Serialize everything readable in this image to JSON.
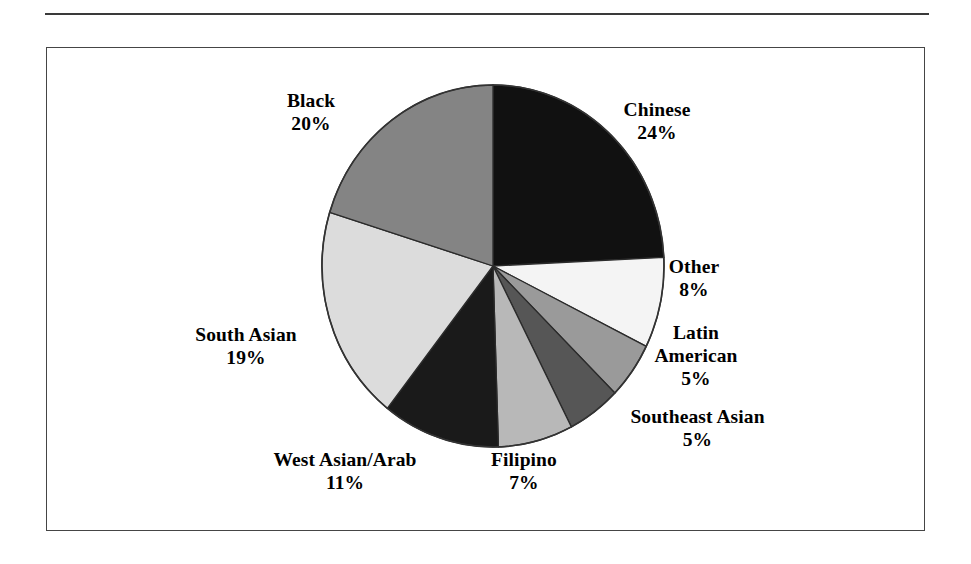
{
  "figure": {
    "background_color": "#ffffff",
    "border_color": "#454545",
    "rule_color": "#3a3a3a"
  },
  "chart_data": {
    "type": "pie",
    "title": "",
    "subtitle": "",
    "xlabel": "",
    "ylabel": "",
    "legend_position": "none",
    "grid": false,
    "start_angle_deg": 0,
    "direction": "clockwise",
    "value_unit": "percent",
    "categories": [
      "Chinese",
      "Other",
      "Latin American",
      "Southeast Asian",
      "Filipino",
      "West Asian/Arab",
      "South Asian",
      "Black"
    ],
    "values": [
      24,
      8,
      5,
      5,
      7,
      11,
      19,
      20
    ],
    "value_labels": [
      "24%",
      "8%",
      "5%",
      "5%",
      "7%",
      "11%",
      "19%",
      "20%"
    ],
    "colors": [
      "#111111",
      "#f4f4f4",
      "#9a9a9a",
      "#565656",
      "#b8b8b8",
      "#1a1a1a",
      "#dcdcdc",
      "#848484"
    ],
    "slices": [
      {
        "label": "Chinese",
        "value": 24,
        "value_label": "24%",
        "color": "#111111"
      },
      {
        "label": "Other",
        "value": 8,
        "value_label": "8%",
        "color": "#f4f4f4"
      },
      {
        "label": "Latin American",
        "value": 5,
        "value_label": "5%",
        "color": "#9a9a9a"
      },
      {
        "label": "Southeast Asian",
        "value": 5,
        "value_label": "5%",
        "color": "#565656"
      },
      {
        "label": "Filipino",
        "value": 7,
        "value_label": "7%",
        "color": "#b8b8b8"
      },
      {
        "label": "West Asian/Arab",
        "value": 11,
        "value_label": "11%",
        "color": "#1a1a1a"
      },
      {
        "label": "South Asian",
        "value": 19,
        "value_label": "19%",
        "color": "#dcdcdc"
      },
      {
        "label": "Black",
        "value": 20,
        "value_label": "20%",
        "color": "#848484"
      }
    ]
  },
  "labels": {
    "black": {
      "name": "Black",
      "value": "20%"
    },
    "chinese": {
      "name": "Chinese",
      "value": "24%"
    },
    "other": {
      "name": "Other",
      "value": "8%"
    },
    "latin_line1": "Latin",
    "latin_line2": "American",
    "latin_value": "5%",
    "southeast": {
      "name": "Southeast Asian",
      "value": "5%"
    },
    "filipino": {
      "name": "Filipino",
      "value": "7%"
    },
    "westasian": {
      "name": "West Asian/Arab",
      "value": "11%"
    },
    "southasian": {
      "name": "South Asian",
      "value": "19%"
    }
  }
}
